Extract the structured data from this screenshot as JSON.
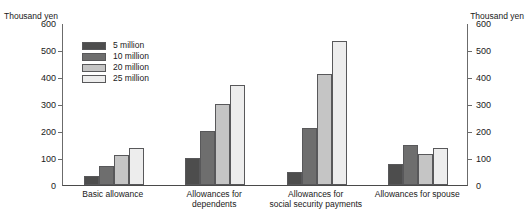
{
  "axes": {
    "unit_caption_left": "Thousand yen",
    "unit_caption_right": "Thousand yen",
    "y_ticks": [
      "600",
      "500",
      "400",
      "300",
      "200",
      "100",
      "0"
    ]
  },
  "legend": {
    "position": "inside-top-left",
    "items": [
      {
        "label": "5 million",
        "color": "#4d4d4d"
      },
      {
        "label": "10 million",
        "color": "#6e6e6e"
      },
      {
        "label": "20 million",
        "color": "#c5c5c5"
      },
      {
        "label": "25 million",
        "color": "#ededed"
      }
    ]
  },
  "chart_data": {
    "type": "bar",
    "title": "",
    "subtitle": "",
    "xlabel": "",
    "ylabel": "Thousand yen",
    "ylim": [
      0,
      600
    ],
    "ytick_step": 100,
    "grid": false,
    "legend_position": "inside-top-left",
    "categories": [
      "Basic allowance",
      "Allowances for dependents",
      "Allowances for\nsocial security payments",
      "Allowances for spouse"
    ],
    "series": [
      {
        "name": "5 million",
        "color": "#4d4d4d",
        "values": [
          33,
          100,
          50,
          76
        ]
      },
      {
        "name": "10 million",
        "color": "#6e6e6e",
        "values": [
          70,
          200,
          213,
          150
        ]
      },
      {
        "name": "20 million",
        "color": "#c5c5c5",
        "values": [
          110,
          300,
          411,
          114
        ]
      },
      {
        "name": "25 million",
        "color": "#ededed",
        "values": [
          136,
          370,
          533,
          138
        ]
      }
    ]
  }
}
